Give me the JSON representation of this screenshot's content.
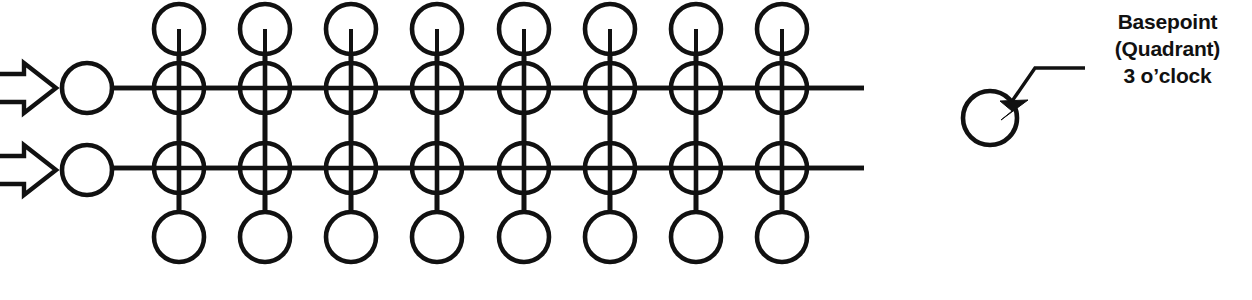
{
  "diagram": {
    "background_color": "#ffffff",
    "ink_color": "#111111",
    "canvas": {
      "width": 1252,
      "height": 300
    },
    "geometry": {
      "circle_radius": 25,
      "column_count": 8,
      "first_column_x": 179,
      "column_spacing": 86.1,
      "row_y": [
        29,
        88,
        168,
        237
      ],
      "basepoint_column_x": 87,
      "horizontal_line_end_x": 864,
      "horizontal_line_start_x": 112
    },
    "rows": [
      {
        "name": "top-stub-row",
        "y": 29,
        "kind": "stub-circles",
        "line_through": false
      },
      {
        "name": "upper-main-row",
        "y": 88,
        "kind": "crossed-circles",
        "line_through": true
      },
      {
        "name": "lower-main-row",
        "y": 168,
        "kind": "crossed-circles",
        "line_through": true
      },
      {
        "name": "bottom-stub-row",
        "y": 237,
        "kind": "stub-circles",
        "line_through": false
      }
    ],
    "basepoints": [
      {
        "name": "basepoint-circle-upper",
        "cx": 87,
        "cy": 88,
        "r": 25
      },
      {
        "name": "basepoint-circle-lower",
        "cx": 87,
        "cy": 170,
        "r": 25
      }
    ],
    "arrows": [
      {
        "name": "flow-arrow-upper",
        "y": 88,
        "direction": "right",
        "style": "hollow-block"
      },
      {
        "name": "flow-arrow-lower",
        "y": 170,
        "direction": "right",
        "style": "hollow-block"
      }
    ]
  },
  "legend": {
    "marker": {
      "name": "legend-basepoint-circle",
      "cx": 990,
      "cy": 118,
      "r": 27
    },
    "leader": {
      "name": "legend-leader-arrow",
      "from_x": 1073,
      "from_y": 68,
      "to_x": 1013,
      "to_y": 108
    },
    "lines": [
      "Basepoint",
      "(Quadrant)",
      "3 o’clock"
    ]
  }
}
